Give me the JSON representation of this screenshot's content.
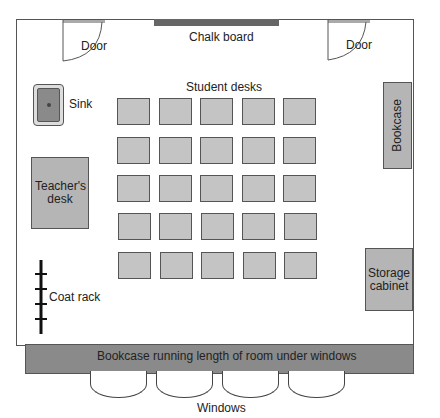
{
  "diagram": {
    "labels": {
      "chalk_board": "Chalk board",
      "door_left": "Door",
      "door_right": "Door",
      "sink": "Sink",
      "student_desks": "Student desks",
      "teachers_desk": "Teacher's desk",
      "bookcase_right": "Bookcase",
      "storage_cabinet": "Storage cabinet",
      "coat_rack": "Coat rack",
      "bookcase_bottom": "Bookcase running length of room under windows",
      "windows": "Windows"
    },
    "student_desk_grid": {
      "rows": 5,
      "columns": 5,
      "count": 25
    },
    "window_count": 4,
    "colors": {
      "wall": "#555555",
      "furniture": "#b5b5b5",
      "desk": "#c4c4c4",
      "chalk_board": "#666666",
      "bookcase_bottom": "#8a8a8a",
      "sink": "#8a8a8a"
    }
  }
}
